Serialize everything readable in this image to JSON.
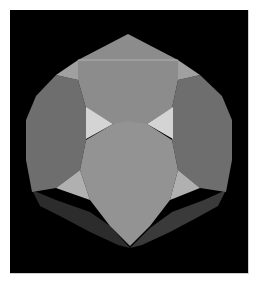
{
  "image": {
    "subject": "truncated octahedron render",
    "background_color": "#000000",
    "page_color": "#ffffff"
  },
  "colors": {
    "top_face": "#8c8c8c",
    "front_face": "#939393",
    "side_faces": "#6e6e6e",
    "upper_square_faces": "#a0a0a0",
    "bright_triangles": "#d4d4d4",
    "lower_square_faces": "#b0b0b0",
    "bottom_faces": "#2c2c2c",
    "bottom_faces_edge": "#3a3a3a",
    "highlight_edge": "#bdbdbd"
  }
}
